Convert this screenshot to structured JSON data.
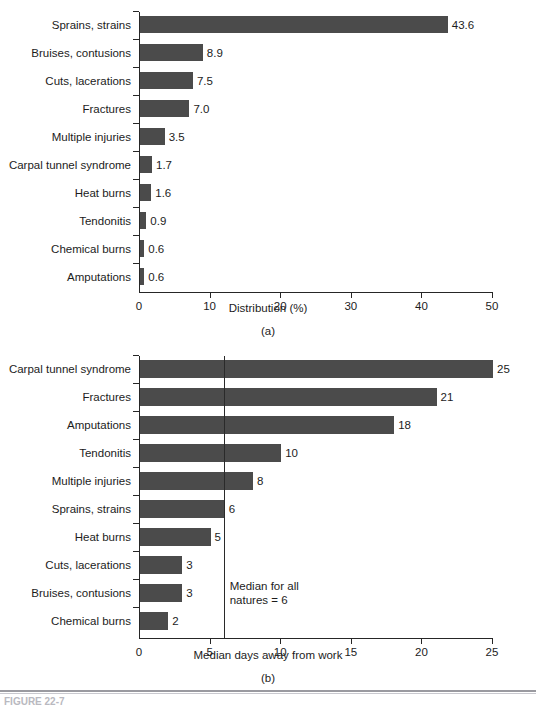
{
  "figure": {
    "panel_a_caption": "(a)",
    "panel_b_caption": "(b)",
    "bar_color": "#4b4b4b",
    "axis_color": "#262626",
    "bottom_caption": "FIGURE 22-7"
  },
  "chart_data": [
    {
      "type": "bar",
      "orientation": "horizontal",
      "panel": "(a)",
      "title": "",
      "xlabel": "Distribution (%)",
      "ylabel": "",
      "xlim": [
        0,
        50
      ],
      "xticks": [
        0,
        10,
        20,
        30,
        40,
        50
      ],
      "xtick_labels": [
        "0",
        "10",
        "20",
        "30",
        "40",
        "50"
      ],
      "grid": false,
      "legend": null,
      "categories": [
        "Sprains, strains",
        "Bruises, contusions",
        "Cuts, lacerations",
        "Fractures",
        "Multiple injuries",
        "Carpal tunnel syndrome",
        "Heat burns",
        "Tendonitis",
        "Chemical burns",
        "Amputations"
      ],
      "values": [
        43.6,
        8.9,
        7.5,
        7.0,
        3.5,
        1.7,
        1.6,
        0.9,
        0.6,
        0.6
      ],
      "value_labels": [
        "43.6",
        "8.9",
        "7.5",
        "7.0",
        "3.5",
        "1.7",
        "1.6",
        "0.9",
        "0.6",
        "0.6"
      ]
    },
    {
      "type": "bar",
      "orientation": "horizontal",
      "panel": "(b)",
      "title": "",
      "xlabel": "Median days away from work",
      "ylabel": "",
      "xlim": [
        0,
        25
      ],
      "xticks": [
        0,
        5,
        10,
        15,
        20,
        25
      ],
      "xtick_labels": [
        "0",
        "5",
        "10",
        "15",
        "20",
        "25"
      ],
      "grid": false,
      "legend": null,
      "categories": [
        "Carpal tunnel syndrome",
        "Fractures",
        "Amputations",
        "Tendonitis",
        "Multiple injuries",
        "Sprains, strains",
        "Heat burns",
        "Cuts, lacerations",
        "Bruises, contusions",
        "Chemical burns"
      ],
      "values": [
        25,
        21,
        18,
        10,
        8,
        6,
        5,
        3,
        3,
        2
      ],
      "value_labels": [
        "25",
        "21",
        "18",
        "10",
        "8",
        "6",
        "5",
        "3",
        "3",
        "2"
      ],
      "annotations": [
        {
          "type": "vline",
          "value": 6,
          "label": "Median for all\nnatures = 6"
        }
      ]
    }
  ]
}
